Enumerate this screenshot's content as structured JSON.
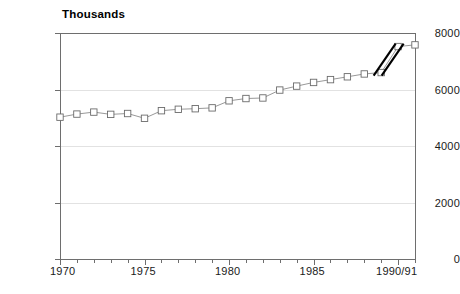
{
  "chart_data": {
    "type": "line",
    "title": "Thousands",
    "subtitle": "",
    "xlabel": "",
    "ylabel": "",
    "ylim": [
      0,
      8000
    ],
    "xlim": [
      1970,
      1991
    ],
    "grid": true,
    "legend": false,
    "legend_position": "none",
    "y_ticks": [
      0,
      2000,
      4000,
      6000,
      8000
    ],
    "y_tick_labels": [
      "0",
      "2000",
      "4000",
      "6000",
      "8000"
    ],
    "x_tick_labels": [
      "1970",
      "1975",
      "1980",
      "1985",
      "1990/91"
    ],
    "x_tick_values": [
      1970,
      1975,
      1980,
      1985,
      1990
    ],
    "x_minor_ticks": [
      1971,
      1972,
      1973,
      1974,
      1976,
      1977,
      1978,
      1979,
      1981,
      1982,
      1983,
      1984,
      1986,
      1987,
      1988,
      1989,
      1991
    ],
    "marker": "open-square",
    "series": [
      {
        "name": "series-1",
        "x": [
          1970,
          1971,
          1972,
          1973,
          1974,
          1975,
          1976,
          1977,
          1978,
          1979,
          1980,
          1981,
          1982,
          1983,
          1984,
          1985,
          1986,
          1987,
          1988,
          1989,
          1990,
          1991
        ],
        "values": [
          5020,
          5130,
          5200,
          5120,
          5150,
          4980,
          5250,
          5300,
          5320,
          5350,
          5600,
          5680,
          5700,
          5980,
          6120,
          6250,
          6350,
          6450,
          6550,
          6600,
          7520,
          7580
        ]
      }
    ],
    "annotations": [
      {
        "name": "series-break-mark",
        "type": "double-slash-break",
        "between_x": [
          1989,
          1990
        ],
        "description": "break in series between 1989 and 1990"
      }
    ],
    "colors": {
      "line": "#8c8c8c",
      "marker_fill": "#ffffff",
      "marker_stroke": "#6b6b6b",
      "axis": "#6e6e6e",
      "grid": "#e2e2e2",
      "text": "#1a1a1a",
      "break_mark": "#000000",
      "background": "#ffffff"
    }
  }
}
